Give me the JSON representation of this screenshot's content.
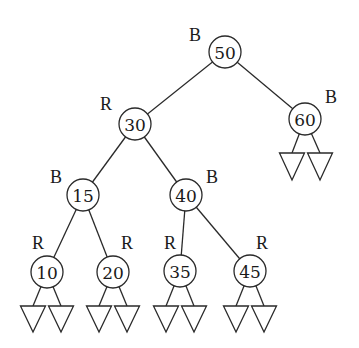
{
  "diagram": {
    "type": "red-black-tree",
    "nodes": [
      {
        "id": "n50",
        "key": "50",
        "color": "B",
        "x": 225,
        "y": 52,
        "label_x": 195,
        "label_y": 35
      },
      {
        "id": "n30",
        "key": "30",
        "color": "R",
        "x": 135,
        "y": 124,
        "label_x": 106,
        "label_y": 104
      },
      {
        "id": "n60",
        "key": "60",
        "color": "B",
        "x": 305,
        "y": 119,
        "label_x": 331,
        "label_y": 97
      },
      {
        "id": "n15",
        "key": "15",
        "color": "B",
        "x": 83,
        "y": 195,
        "label_x": 56,
        "label_y": 177
      },
      {
        "id": "n40",
        "key": "40",
        "color": "B",
        "x": 186,
        "y": 195,
        "label_x": 212,
        "label_y": 177
      },
      {
        "id": "n10",
        "key": "10",
        "color": "R",
        "x": 47,
        "y": 272,
        "label_x": 38,
        "label_y": 243
      },
      {
        "id": "n20",
        "key": "20",
        "color": "R",
        "x": 113,
        "y": 272,
        "label_x": 127,
        "label_y": 243
      },
      {
        "id": "n35",
        "key": "35",
        "color": "R",
        "x": 180,
        "y": 271,
        "label_x": 170,
        "label_y": 243
      },
      {
        "id": "n45",
        "key": "45",
        "color": "R",
        "x": 250,
        "y": 271,
        "label_x": 262,
        "label_y": 243
      }
    ],
    "edges": [
      {
        "from": "n50",
        "to": "n30"
      },
      {
        "from": "n50",
        "to": "n60"
      },
      {
        "from": "n30",
        "to": "n15"
      },
      {
        "from": "n30",
        "to": "n40"
      },
      {
        "from": "n15",
        "to": "n10"
      },
      {
        "from": "n15",
        "to": "n20"
      },
      {
        "from": "n40",
        "to": "n35"
      },
      {
        "from": "n40",
        "to": "n45"
      }
    ],
    "leaves": [
      {
        "parent": "n60",
        "cx": 292,
        "top": 153,
        "bottom": 180
      },
      {
        "parent": "n60",
        "cx": 320,
        "top": 153,
        "bottom": 180
      },
      {
        "parent": "n10",
        "cx": 33,
        "top": 306,
        "bottom": 332
      },
      {
        "parent": "n10",
        "cx": 61,
        "top": 306,
        "bottom": 332
      },
      {
        "parent": "n20",
        "cx": 99,
        "top": 306,
        "bottom": 332
      },
      {
        "parent": "n20",
        "cx": 127,
        "top": 306,
        "bottom": 332
      },
      {
        "parent": "n35",
        "cx": 166,
        "top": 306,
        "bottom": 332
      },
      {
        "parent": "n35",
        "cx": 194,
        "top": 306,
        "bottom": 332
      },
      {
        "parent": "n45",
        "cx": 236,
        "top": 306,
        "bottom": 332
      },
      {
        "parent": "n45",
        "cx": 264,
        "top": 306,
        "bottom": 332
      }
    ],
    "node_radius": 16,
    "leaf_half_width": 12.5,
    "legend": {
      "B": "black",
      "R": "red"
    }
  }
}
